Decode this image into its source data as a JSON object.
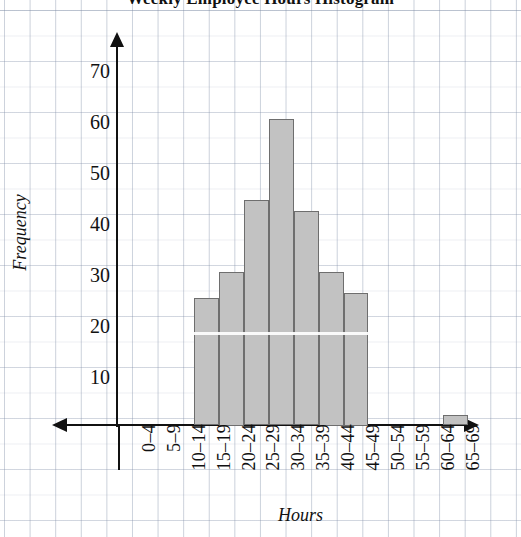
{
  "chart_data": {
    "type": "bar",
    "title": "Weekly Employee Hours Histogram",
    "xlabel": "Hours",
    "ylabel": "Frequency",
    "categories": [
      "0–4",
      "5–9",
      "10–14",
      "15–19",
      "20–24",
      "25–29",
      "30–34",
      "35–39",
      "40–44",
      "45–49",
      "50–54",
      "55–59",
      "60–64",
      "65–69"
    ],
    "values": [
      0,
      0,
      0,
      25,
      30,
      44,
      60,
      42,
      30,
      26,
      0,
      0,
      0,
      2
    ],
    "ylim": [
      0,
      74
    ],
    "yticks": [
      10,
      20,
      30,
      40,
      50,
      60,
      70
    ],
    "ytick_labels": [
      "10",
      "20",
      "30",
      "40",
      "50",
      "60",
      "70"
    ],
    "grid": true,
    "legend": false,
    "bar_fill_color": "#c2c2c2",
    "bar_edge_color": "#6e6e6e",
    "axis_color": "#111111",
    "grid_color": "#96a0b4",
    "background_color": "#ffffff"
  },
  "axes": {
    "y_title": "Frequency",
    "x_title": "Hours"
  },
  "header": {
    "title": "Weekly Employee Hours Histogram"
  }
}
